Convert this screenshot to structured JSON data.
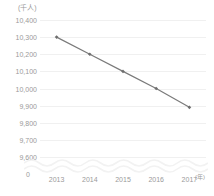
{
  "chart_data": {
    "type": "line",
    "title": "",
    "xlabel": "(年)",
    "ylabel": "(千人)",
    "categories": [
      "2013",
      "2014",
      "2015",
      "2016",
      "2017"
    ],
    "values": [
      10300,
      10200,
      10100,
      10000,
      9890
    ],
    "series": [
      {
        "name": "",
        "values": [
          10300,
          10200,
          10100,
          10000,
          9890
        ]
      }
    ],
    "ylim": [
      9600,
      10400
    ],
    "y_ticks": [
      "10,400",
      "10,300",
      "10,200",
      "10,100",
      "10,000",
      "9,900",
      "9,800",
      "9,700",
      "9,600"
    ],
    "y_tick_values": [
      10400,
      10300,
      10200,
      10100,
      10000,
      9900,
      9800,
      9700,
      9600
    ],
    "zero_tick": "0",
    "grid": true,
    "legend": "none",
    "axis_break": true,
    "marker": "diamond",
    "colors": {
      "line": "#7a7a7a",
      "marker": "#6e6e6e",
      "grid": "#f0f0f0",
      "text": "#9a9a9a",
      "background": "#ffffff"
    }
  }
}
